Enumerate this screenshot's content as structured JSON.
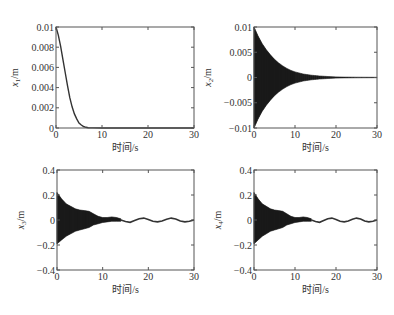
{
  "figure": {
    "width": 394,
    "height": 315,
    "line_color": "#333333",
    "fill_color": "#222222"
  },
  "chart_data": [
    {
      "type": "line",
      "name": "x1",
      "ylabel_main": "x",
      "ylabel_sub": "1",
      "ylabel_unit": "/m",
      "xlabel": "时间/s",
      "xlim": [
        0,
        30
      ],
      "ylim": [
        0,
        0.01
      ],
      "xticks": [
        0,
        10,
        20,
        30
      ],
      "xtick_labels": [
        "0",
        "10",
        "20",
        "30"
      ],
      "yticks": [
        0,
        0.002,
        0.004,
        0.006,
        0.008,
        0.01
      ],
      "ytick_labels": [
        "0",
        "0.002",
        "0.004",
        "0.006",
        "0.008",
        "0.01"
      ],
      "box": {
        "left": 56,
        "top": 27,
        "right": 194,
        "bottom": 128
      },
      "description": "Monotonic decay from 0.01 at t=0 to ~0 by t≈7 s",
      "x": [
        0,
        0.5,
        1,
        1.5,
        2,
        2.5,
        3,
        3.5,
        4,
        4.5,
        5,
        5.5,
        6,
        6.5,
        7,
        8,
        10,
        15,
        20,
        25,
        30
      ],
      "y": [
        0.01,
        0.0092,
        0.0081,
        0.0068,
        0.0055,
        0.0042,
        0.003,
        0.0021,
        0.0014,
        0.0009,
        0.0005,
        0.0003,
        0.00015,
        7e-05,
        3e-05,
        1e-05,
        0,
        0,
        0,
        0,
        0
      ]
    },
    {
      "type": "area",
      "name": "x2",
      "ylabel_main": "x",
      "ylabel_sub": "2",
      "ylabel_unit": "/m",
      "xlabel": "时间/s",
      "xlim": [
        0,
        30
      ],
      "ylim": [
        -0.01,
        0.01
      ],
      "xticks": [
        0,
        10,
        20,
        30
      ],
      "xtick_labels": [
        "0",
        "10",
        "20",
        "30"
      ],
      "yticks": [
        -0.01,
        -0.005,
        0,
        0.005,
        0.01
      ],
      "ytick_labels": [
        "−0.01",
        "−0.005",
        "0",
        "0.005",
        "0.01"
      ],
      "box": {
        "left": 254,
        "top": 27,
        "right": 377,
        "bottom": 128
      },
      "description": "High-frequency oscillation with envelope decaying from ±0.01 to ~0 by t≈20 s",
      "envelope_x": [
        0,
        1,
        2,
        3,
        4,
        5,
        6,
        7,
        8,
        9,
        10,
        12,
        14,
        16,
        18,
        20,
        22,
        25,
        30
      ],
      "envelope_upper": [
        0.01,
        0.0082,
        0.0067,
        0.0055,
        0.0045,
        0.0036,
        0.0029,
        0.0023,
        0.0018,
        0.0014,
        0.0011,
        0.0007,
        0.00045,
        0.0003,
        0.0002,
        0.00012,
        8e-05,
        5e-05,
        3e-05
      ],
      "envelope_lower": [
        -0.01,
        -0.0082,
        -0.0067,
        -0.0055,
        -0.0045,
        -0.0036,
        -0.0029,
        -0.0023,
        -0.0018,
        -0.0014,
        -0.0011,
        -0.0007,
        -0.00045,
        -0.0003,
        -0.0002,
        -0.00012,
        -8e-05,
        -5e-05,
        -3e-05
      ]
    },
    {
      "type": "area",
      "name": "x3",
      "ylabel_main": "x",
      "ylabel_sub": "3",
      "ylabel_unit": "/m",
      "xlabel": "时间/s",
      "xlim": [
        0,
        30
      ],
      "ylim": [
        -0.4,
        0.4
      ],
      "xticks": [
        0,
        10,
        20,
        30
      ],
      "xtick_labels": [
        "0",
        "10",
        "20",
        "30"
      ],
      "yticks": [
        -0.4,
        -0.2,
        0,
        0.2,
        0.4
      ],
      "ytick_labels": [
        "−0.4",
        "−0.2",
        "0",
        "0.2",
        "0.4"
      ],
      "box": {
        "left": 57,
        "top": 170,
        "right": 194,
        "bottom": 270
      },
      "description": "Dense oscillation with envelope ±0.22 at t=0 decaying to ±0.02 by t≈12 s, followed by slow low-amplitude wave (~±0.015)",
      "envelope_x": [
        0,
        1,
        2,
        3,
        4,
        5,
        6,
        7,
        8,
        9,
        10,
        11,
        12,
        13,
        14
      ],
      "envelope_upper": [
        0.22,
        0.17,
        0.13,
        0.11,
        0.09,
        0.08,
        0.075,
        0.07,
        0.05,
        0.03,
        0.02,
        0.02,
        0.025,
        0.02,
        0.01
      ],
      "envelope_lower": [
        -0.19,
        -0.16,
        -0.13,
        -0.11,
        -0.09,
        -0.08,
        -0.07,
        -0.06,
        -0.04,
        -0.03,
        -0.02,
        -0.015,
        -0.01,
        -0.01,
        -0.01
      ],
      "tail_x": [
        14,
        15,
        16,
        17,
        18,
        19,
        20,
        21,
        22,
        23,
        24,
        25,
        26,
        27,
        28,
        29,
        30
      ],
      "tail_y": [
        0.0,
        -0.012,
        -0.018,
        -0.005,
        0.01,
        0.015,
        0.005,
        -0.01,
        -0.015,
        -0.008,
        0.006,
        0.015,
        0.008,
        -0.008,
        -0.015,
        -0.01,
        0.0
      ]
    },
    {
      "type": "area",
      "name": "x4",
      "ylabel_main": "x",
      "ylabel_sub": "4",
      "ylabel_unit": "/m",
      "xlabel": "时间/s",
      "xlim": [
        0,
        30
      ],
      "ylim": [
        -0.4,
        0.4
      ],
      "xticks": [
        0,
        10,
        20,
        30
      ],
      "xtick_labels": [
        "0",
        "10",
        "20",
        "30"
      ],
      "yticks": [
        -0.4,
        -0.2,
        0,
        0.2,
        0.4
      ],
      "ytick_labels": [
        "−0.4",
        "−0.2",
        "0",
        "0.2",
        "0.4"
      ],
      "box": {
        "left": 254,
        "top": 170,
        "right": 377,
        "bottom": 270
      },
      "description": "Same behaviour as x3: dense oscillation ±0.22 decaying by t≈12 s, then slow low-amplitude wave",
      "envelope_x": [
        0,
        1,
        2,
        3,
        4,
        5,
        6,
        7,
        8,
        9,
        10,
        11,
        12,
        13,
        14
      ],
      "envelope_upper": [
        0.22,
        0.17,
        0.13,
        0.11,
        0.09,
        0.08,
        0.075,
        0.07,
        0.05,
        0.03,
        0.02,
        0.02,
        0.025,
        0.02,
        0.01
      ],
      "envelope_lower": [
        -0.19,
        -0.16,
        -0.13,
        -0.11,
        -0.09,
        -0.08,
        -0.07,
        -0.06,
        -0.04,
        -0.03,
        -0.02,
        -0.015,
        -0.01,
        -0.01,
        -0.01
      ],
      "tail_x": [
        14,
        15,
        16,
        17,
        18,
        19,
        20,
        21,
        22,
        23,
        24,
        25,
        26,
        27,
        28,
        29,
        30
      ],
      "tail_y": [
        0.0,
        -0.012,
        -0.018,
        -0.005,
        0.01,
        0.015,
        0.005,
        -0.01,
        -0.015,
        -0.008,
        0.006,
        0.015,
        0.008,
        -0.008,
        -0.015,
        -0.01,
        0.0
      ]
    }
  ]
}
